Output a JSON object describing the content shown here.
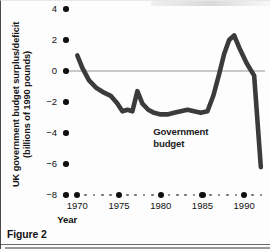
{
  "figure": {
    "caption": "Figure 2"
  },
  "chart_data": {
    "type": "line",
    "title": "",
    "subtitle": "",
    "xlabel": "Year",
    "ylabel": "UK government budget surplus/deficit (billions of 1990 pounds)",
    "ylabel_line1": "UK government budget surplus/deficit",
    "ylabel_line2": "(billions of 1990 pounds)",
    "xlim": [
      1969,
      1992.5
    ],
    "ylim": [
      -8,
      4
    ],
    "yticks": [
      4,
      2,
      0,
      -2,
      -4,
      -6,
      -8
    ],
    "ytick_labels": [
      "4",
      "2",
      "0",
      "−2",
      "−4",
      "−6",
      "−8"
    ],
    "xticks": [
      1970,
      1975,
      1980,
      1985,
      1990
    ],
    "xtick_labels": [
      "1970",
      "1975",
      "1980",
      "1985",
      "1990"
    ],
    "grid": false,
    "zero_line": true,
    "legend_position": "inline-annotation",
    "series": [
      {
        "name": "Government budget",
        "annotation_line1": "Government",
        "annotation_line2": "budget",
        "color": "#3b3b3b",
        "line_width": 4.6,
        "x": [
          1970,
          1970.6,
          1971.4,
          1972.3,
          1973.2,
          1974.0,
          1974.8,
          1975.4,
          1976.0,
          1976.6,
          1977.2,
          1977.8,
          1978.5,
          1979.2,
          1980.0,
          1980.8,
          1981.6,
          1982.4,
          1983.2,
          1984.0,
          1984.8,
          1985.6,
          1986.3,
          1987.0,
          1987.6,
          1988.2,
          1988.8,
          1989.5,
          1990.3,
          1991.2,
          1992.0
        ],
        "y": [
          1.0,
          0.2,
          -0.6,
          -1.1,
          -1.4,
          -1.6,
          -2.1,
          -2.6,
          -2.5,
          -2.6,
          -1.3,
          -2.1,
          -2.5,
          -2.7,
          -2.8,
          -2.8,
          -2.7,
          -2.6,
          -2.5,
          -2.6,
          -2.7,
          -2.6,
          -1.6,
          -0.2,
          1.1,
          2.0,
          2.3,
          1.4,
          0.5,
          -0.3,
          -6.2
        ]
      }
    ]
  }
}
